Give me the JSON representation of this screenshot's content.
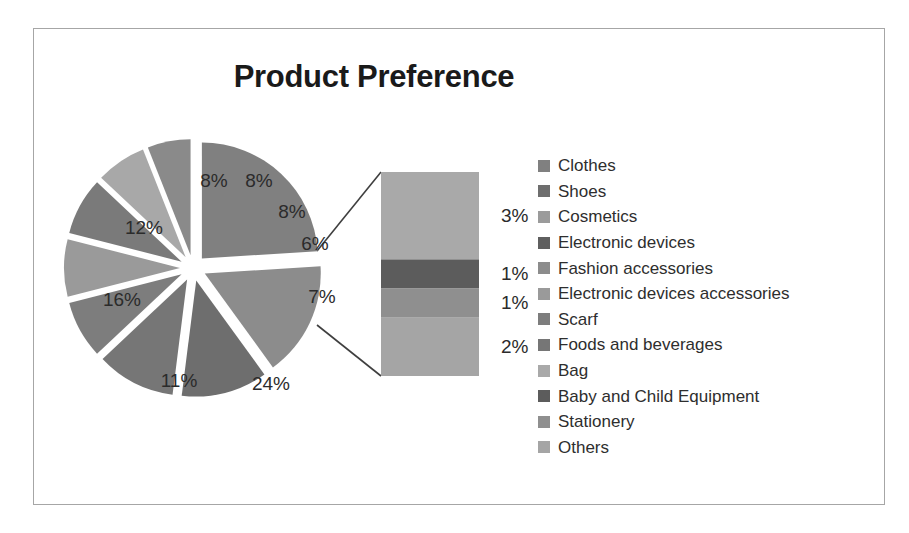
{
  "chart_data": {
    "type": "pie",
    "variant": "bar-of-pie",
    "title": "Product Preference",
    "xlabel": "",
    "ylabel": "",
    "legend_position": "right",
    "grid": false,
    "value_unit": "%",
    "categories": [
      "Clothes",
      "Shoes",
      "Cosmetics",
      "Electronic devices",
      "Fashion accessories",
      "Electronic devices accessories",
      "Scarf",
      "Foods and beverages",
      "Bag",
      "Baby and Child Equipment",
      "Stationery",
      "Others"
    ],
    "values": [
      24,
      16,
      12,
      11,
      8,
      8,
      8,
      7,
      6,
      3,
      1,
      1
    ],
    "pie_slices": [
      {
        "label": "24%",
        "value": 24,
        "color": "#808080",
        "x": 237,
        "y": 355
      },
      {
        "label": "16%",
        "value": 16,
        "color": "#8c8c8c",
        "x": 88,
        "y": 271
      },
      {
        "label": "12%",
        "value": 12,
        "color": "#6e6e6e",
        "x": 110,
        "y": 199
      },
      {
        "label": "11%",
        "value": 11,
        "color": "#767676",
        "x": 145,
        "y": 352
      },
      {
        "label": "8%",
        "value": 8,
        "color": "#7d7d7d",
        "x": 180,
        "y": 152
      },
      {
        "label": "8%",
        "value": 8,
        "color": "#9a9a9a",
        "x": 225,
        "y": 152
      },
      {
        "label": "8%",
        "value": 8,
        "color": "#7a7a7a",
        "x": 258,
        "y": 183
      },
      {
        "label": "7%",
        "value": 7,
        "color": "#a8a8a8",
        "x": 288,
        "y": 268
      },
      {
        "label": "6%",
        "value": 6,
        "color": "#8a8a8a",
        "x": 281,
        "y": 215
      }
    ],
    "bar_of_pie": {
      "source_slice_label": "7%",
      "source_slice_value": 7,
      "segments": [
        {
          "label": "3%",
          "value": 3,
          "category": "Bag",
          "color": "#a9a9a9"
        },
        {
          "label": "1%",
          "value": 1,
          "category": "Baby and Child Equipment",
          "color": "#5c5c5c"
        },
        {
          "label": "1%",
          "value": 1,
          "category": "Stationery",
          "color": "#8f8f8f"
        },
        {
          "label": "2%",
          "value": 2,
          "category": "Others",
          "color": "#a5a5a5"
        }
      ]
    },
    "legend": [
      {
        "label": "Clothes",
        "color": "#808080"
      },
      {
        "label": "Shoes",
        "color": "#6e6e6e"
      },
      {
        "label": "Cosmetics",
        "color": "#9b9b9b"
      },
      {
        "label": "Electronic devices",
        "color": "#5f5f5f"
      },
      {
        "label": "Fashion accessories",
        "color": "#8c8c8c"
      },
      {
        "label": "Electronic devices accessories",
        "color": "#9a9a9a"
      },
      {
        "label": "Scarf",
        "color": "#7d7d7d"
      },
      {
        "label": "Foods and beverages",
        "color": "#767676"
      },
      {
        "label": "Bag",
        "color": "#a9a9a9"
      },
      {
        "label": "Baby and Child Equipment",
        "color": "#5c5c5c"
      },
      {
        "label": "Stationery",
        "color": "#8f8f8f"
      },
      {
        "label": "Others",
        "color": "#a5a5a5"
      }
    ]
  }
}
